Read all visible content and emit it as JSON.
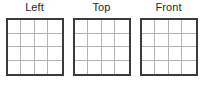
{
  "canvas": {
    "width": 203,
    "height": 89,
    "background": "#ffffff"
  },
  "style": {
    "border_color": "#3b3b3b",
    "gridline_color": "#b3b3b3",
    "label_color": "#272727"
  },
  "diagram": {
    "title": "",
    "views": [
      {
        "label": "Left",
        "rows": 4,
        "cols": 4
      },
      {
        "label": "Top",
        "rows": 4,
        "cols": 4
      },
      {
        "label": "Front",
        "rows": 4,
        "cols": 4
      }
    ]
  }
}
